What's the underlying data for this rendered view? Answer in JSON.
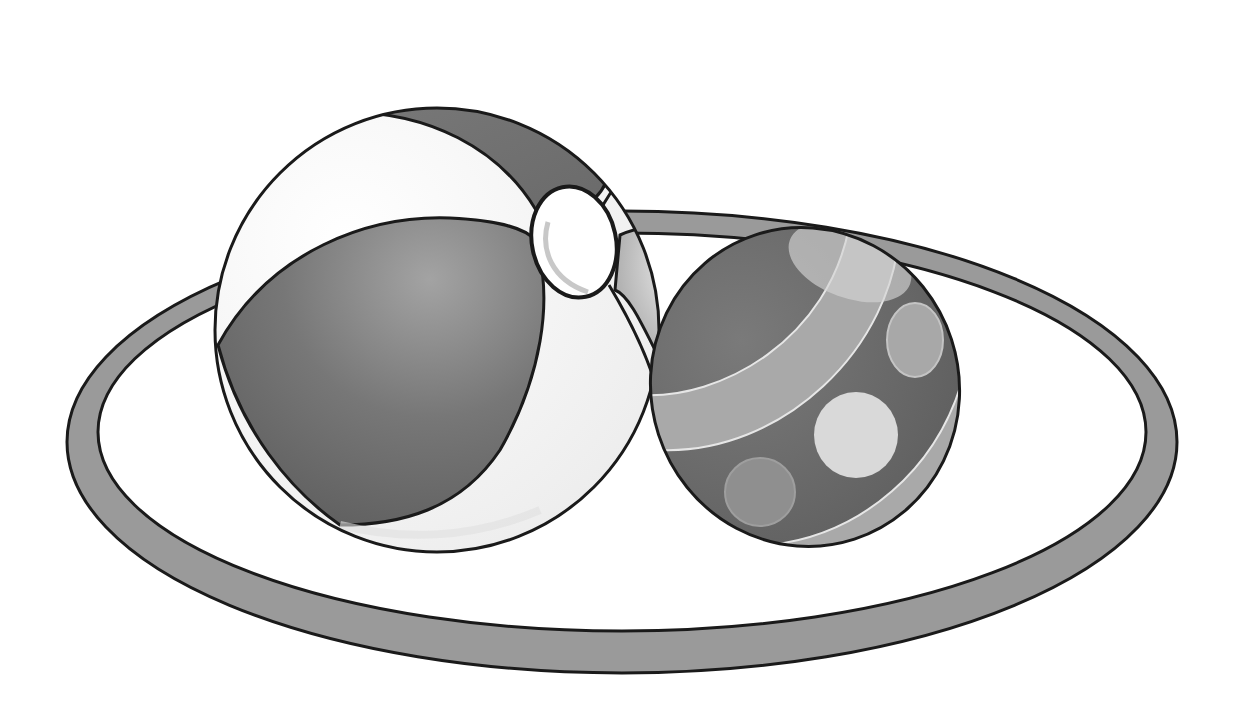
{
  "image": {
    "width": 1241,
    "height": 712,
    "background": "#ffffff",
    "description": "Grayscale clip-art of a beach ball and a striped spotted ball resting inside a hoop ring"
  },
  "objects": [
    {
      "name": "hoop-ring",
      "shape": "ellipse-band",
      "cx": 622,
      "cy": 442,
      "rx": 540,
      "ry": 216,
      "band_width": 30,
      "fill": "#9a9a9a",
      "stroke": "#1a1a1a"
    },
    {
      "name": "beach-ball",
      "shape": "circle",
      "cx": 437,
      "cy": 330,
      "r": 222,
      "panel_dark": "#6e6e6e",
      "panel_light": "#f4f4f4",
      "panel_mid": "#8a8a8a",
      "stroke": "#1a1a1a"
    },
    {
      "name": "beach-ball-valve",
      "shape": "ellipse",
      "cx": 574,
      "cy": 242,
      "rx": 42,
      "ry": 56,
      "fill": "#ffffff"
    },
    {
      "name": "spotted-ball",
      "shape": "circle",
      "cx": 805,
      "cy": 387,
      "r": 156,
      "base": "#6a6a6a",
      "stripe": "#a8a8a8",
      "spot_light": "#d6d6d6",
      "spot_mid": "#9c9c9c",
      "stroke": "#1a1a1a"
    }
  ],
  "colors": {
    "outline": "#1a1a1a",
    "ring_fill": "#9a9a9a",
    "dark_panel": "#6c6c6c",
    "light_panel": "#f5f5f5",
    "stripe": "#a9a9a9",
    "highlight": "#dcdcdc"
  }
}
